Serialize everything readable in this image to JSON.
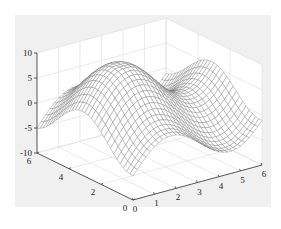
{
  "chart_data": {
    "type": "surface",
    "title": "",
    "xlabel": "",
    "ylabel": "",
    "zlabel": "",
    "xlim": [
      0,
      6
    ],
    "ylim": [
      0,
      6
    ],
    "zlim": [
      -10,
      10
    ],
    "x_ticks": [
      "0",
      "1",
      "2",
      "3",
      "4",
      "5",
      "6"
    ],
    "y_ticks": [
      "0",
      "2",
      "4",
      "6"
    ],
    "z_ticks": [
      "-10",
      "-5",
      "0",
      "5",
      "10"
    ],
    "grid": true,
    "legend": null,
    "surface": {
      "style": "mesh",
      "edge_color": "#7a7a7a",
      "face_color": "#ffffff",
      "grid_points_x": 31,
      "grid_points_y": 31,
      "description": "Wavy mesh surface with a ridge near x≈1.5 along y=6 (≈8), a peak near the back-right (≈10), and a trough at the front center (≈-8)"
    }
  },
  "colors": {
    "figure_background": "#f0f0f0",
    "axes_background": "#ffffff",
    "grid": "#dcdcdc",
    "axis": "#333333",
    "mesh": "#6e6e6e"
  }
}
